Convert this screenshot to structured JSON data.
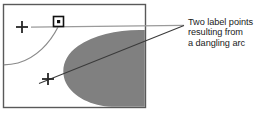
{
  "figure": {
    "type": "technical-illustration",
    "caption_lines": [
      "Two label points",
      "resulting from",
      "a dangling arc"
    ],
    "colors": {
      "background": "#ffffff",
      "frame_border": "#595959",
      "polygon_fill": "#808080",
      "ink": "#1a1a1a",
      "leader_line": "#7a7a7a",
      "arc": "#8a8a8a"
    },
    "frame": {
      "x": 3,
      "y": 4,
      "width": 143,
      "height": 104
    },
    "elements": {
      "label_point_upper": {
        "name": "label-point-cross-upper",
        "x": 22,
        "y": 27,
        "size": 7
      },
      "label_point_lower": {
        "name": "label-point-cross-lower",
        "x": 48,
        "y": 79,
        "size": 7
      },
      "node_marker": {
        "name": "node-square-marker",
        "x": 58,
        "y": 22,
        "size": 10
      },
      "dangling_arc": {
        "name": "dangling-arc",
        "from_x": 58,
        "from_y": 26,
        "to_x": 3,
        "to_y": 64
      },
      "polygon_blob": {
        "name": "gray-polygon-region"
      },
      "leader_upper": {
        "name": "leader-line-upper",
        "from_x": 31,
        "from_y": 27,
        "to_x": 185,
        "to_y": 25
      },
      "leader_lower": {
        "name": "leader-line-lower",
        "from_x": 40,
        "from_y": 83,
        "to_x": 185,
        "to_y": 25
      }
    }
  }
}
